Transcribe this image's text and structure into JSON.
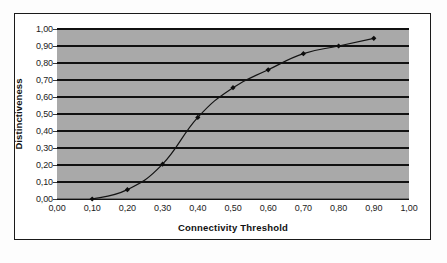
{
  "chart_data": {
    "type": "line",
    "title": "",
    "xlabel": "Connectivity Threshold",
    "ylabel": "Distinctiveness",
    "xlim": [
      0.0,
      1.0
    ],
    "ylim": [
      0.0,
      1.0
    ],
    "grid": true,
    "grid_orientation": "horizontal",
    "legend": "none",
    "decimal_separator": ",",
    "marker": "diamond",
    "x": [
      0.1,
      0.2,
      0.3,
      0.4,
      0.5,
      0.6,
      0.7,
      0.8,
      0.9
    ],
    "values": [
      0.0,
      0.055,
      0.205,
      0.48,
      0.655,
      0.76,
      0.855,
      0.9,
      0.945
    ],
    "series": [
      {
        "name": "Distinctiveness",
        "values": [
          0.0,
          0.055,
          0.205,
          0.48,
          0.655,
          0.76,
          0.855,
          0.9,
          0.945
        ]
      }
    ],
    "xticks": [
      "0,00",
      "0,10",
      "0,20",
      "0,30",
      "0,40",
      "0,50",
      "0,60",
      "0,70",
      "0,80",
      "0,90",
      "1,00"
    ],
    "xtick_values": [
      0.0,
      0.1,
      0.2,
      0.3,
      0.4,
      0.5,
      0.6,
      0.7,
      0.8,
      0.9,
      1.0
    ],
    "yticks": [
      "0,00",
      "0,10",
      "0,20",
      "0,30",
      "0,40",
      "0,50",
      "0,60",
      "0,70",
      "0,80",
      "0,90",
      "1,00"
    ],
    "ytick_values": [
      0.0,
      0.1,
      0.2,
      0.3,
      0.4,
      0.5,
      0.6,
      0.7,
      0.8,
      0.9,
      1.0
    ],
    "colors": {
      "plot_background": "#a9a9a9",
      "gridline": "#111111",
      "line": "#141414",
      "marker": "#0d0d0d",
      "figure_background": "#ffffff",
      "border": "#1a1a1a",
      "text": "#1c1c1c"
    }
  }
}
